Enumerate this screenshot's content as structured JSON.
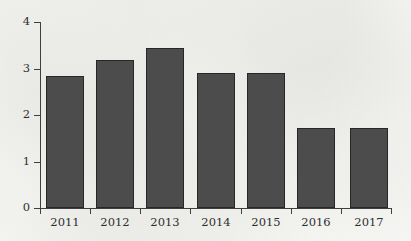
{
  "chart_data": {
    "type": "bar",
    "title": "",
    "subtitle": "",
    "xlabel": "",
    "ylabel": "",
    "categories": [
      "2011",
      "2012",
      "2013",
      "2014",
      "2015",
      "2016",
      "2017"
    ],
    "values": [
      2.83,
      3.19,
      3.44,
      2.9,
      2.91,
      1.73,
      1.73
    ],
    "series": [
      {
        "name": "",
        "values": [
          2.83,
          3.19,
          3.44,
          2.9,
          2.91,
          1.73,
          1.73
        ]
      }
    ],
    "ylim": [
      0,
      4
    ],
    "xlim_categories": 7,
    "y_ticks": [
      "0",
      "1",
      "2",
      "3",
      "4"
    ],
    "y_tick_values": [
      0,
      1,
      2,
      3,
      4
    ],
    "x_ticks": [
      "2011",
      "2012",
      "2013",
      "2014",
      "2015",
      "2016",
      "2017"
    ],
    "grid": false,
    "legend": false,
    "legend_position": "none",
    "annotations": [],
    "colors": {
      "bar_fill": "#4c4c4c",
      "bar_edge": "#272727",
      "axis": "#3f3f3f",
      "text": "#2e2e2e",
      "background": "#f8f8f6"
    }
  },
  "axis": {
    "y_labels": [
      "4",
      "3",
      "2",
      "1",
      "0"
    ],
    "x_labels": [
      "2011",
      "2012",
      "2013",
      "2014",
      "2015",
      "2016",
      "2017"
    ]
  }
}
